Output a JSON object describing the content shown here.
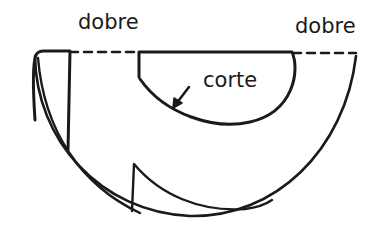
{
  "diagram": {
    "type": "pattern-fold-cut-diagram",
    "labels": {
      "fold_left": "dobre",
      "fold_right": "dobre",
      "cut": "corte"
    },
    "colors": {
      "background": "#ffffff",
      "stroke": "#1a1a1a"
    },
    "elements": [
      {
        "id": "fold-line",
        "style": "dashed",
        "meaning": "dobre (fold)"
      },
      {
        "id": "outer-semicircle",
        "style": "solid"
      },
      {
        "id": "inner-cut-semicircle",
        "style": "solid",
        "meaning": "corte (cut)"
      },
      {
        "id": "left-flap",
        "style": "solid"
      },
      {
        "id": "lower-flap",
        "style": "solid"
      },
      {
        "id": "cut-arrow",
        "style": "solid",
        "points_to": "inner-cut-semicircle"
      }
    ]
  }
}
